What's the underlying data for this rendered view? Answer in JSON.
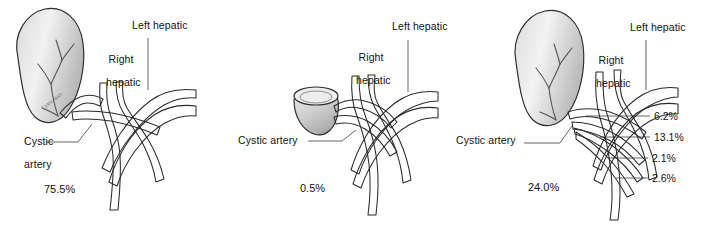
{
  "figure": {
    "name": "cystic-artery-anatomy-variants",
    "background": "#ffffff",
    "vessel_fill_light": "#e8e8e8",
    "vessel_fill_mid": "#bdbdbd",
    "vessel_fill_dark": "#8f8f8f",
    "outline_color": "#2b2b2b",
    "label_color": "#111111"
  },
  "panels": [
    {
      "id": "panel-1",
      "percent": "75.5%",
      "labels": {
        "cystic_artery_line1": "Cystic",
        "cystic_artery_line2": "artery",
        "right_hepatic_line1": "Right",
        "right_hepatic_line2": "hepatic",
        "left_hepatic": "Left hepatic",
        "gallbladder_note": "Cystic duct"
      },
      "gallbladder": "full-elongated",
      "measurements": []
    },
    {
      "id": "panel-2",
      "percent": "0.5%",
      "labels": {
        "cystic_artery": "Cystic artery",
        "right_hepatic_line1": "Right",
        "right_hepatic_line2": "hepatic",
        "left_hepatic": "Left hepatic"
      },
      "gallbladder": "cup-remnant",
      "measurements": []
    },
    {
      "id": "panel-3",
      "percent": "24.0%",
      "labels": {
        "cystic_artery": "Cystic artery",
        "right_hepatic_line1": "Right",
        "right_hepatic_line2": "hepatic",
        "left_hepatic": "Left hepatic"
      },
      "gallbladder": "full-elongated",
      "measurements": [
        "6.2%",
        "13.1%",
        "2.1%",
        "2.6%"
      ]
    }
  ]
}
